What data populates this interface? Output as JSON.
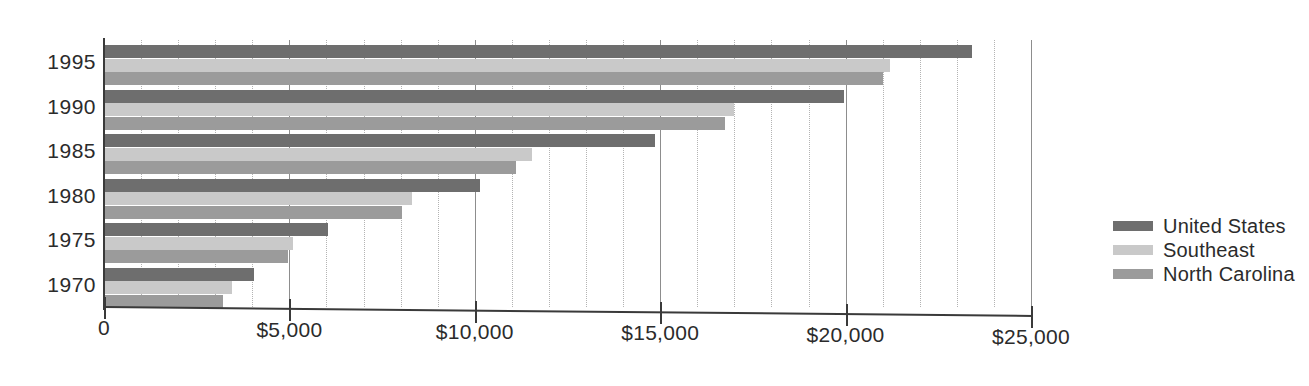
{
  "chart_data": {
    "type": "bar",
    "orientation": "horizontal",
    "title": "",
    "subtitle": "",
    "xlabel": "",
    "ylabel": "",
    "categories": [
      "1995",
      "1990",
      "1985",
      "1980",
      "1975",
      "1970"
    ],
    "series": [
      {
        "name": "United States",
        "color": "#6e6e6e",
        "values": [
          23400,
          19950,
          14850,
          10150,
          6050,
          4050
        ]
      },
      {
        "name": "Southeast",
        "color": "#c9c9c9",
        "values": [
          21200,
          17000,
          11550,
          8300,
          5100,
          3450
        ]
      },
      {
        "name": "North Carolina",
        "color": "#9b9b9b",
        "values": [
          21000,
          16750,
          11100,
          8050,
          4950,
          3200
        ]
      }
    ],
    "xlim": [
      0,
      25000
    ],
    "x_major_ticks": [
      0,
      5000,
      10000,
      15000,
      20000,
      25000
    ],
    "x_tick_labels": [
      "0",
      "$5,000",
      "$10,000",
      "$15,000",
      "$20,000",
      "$25,000"
    ],
    "x_minor_tick_interval": 1000,
    "grid": "vertical-major-solid-minor-dotted",
    "legend_position": "right"
  },
  "axis": {
    "x_labels": [
      "0",
      "$5,000",
      "$10,000",
      "$15,000",
      "$20,000",
      "$25,000"
    ],
    "y_labels": [
      "1995",
      "1990",
      "1985",
      "1980",
      "1975",
      "1970"
    ]
  },
  "legend": {
    "entries": [
      {
        "label": "United States",
        "color": "#6e6e6e"
      },
      {
        "label": "Southeast",
        "color": "#c9c9c9"
      },
      {
        "label": "North Carolina",
        "color": "#9b9b9b"
      }
    ]
  }
}
